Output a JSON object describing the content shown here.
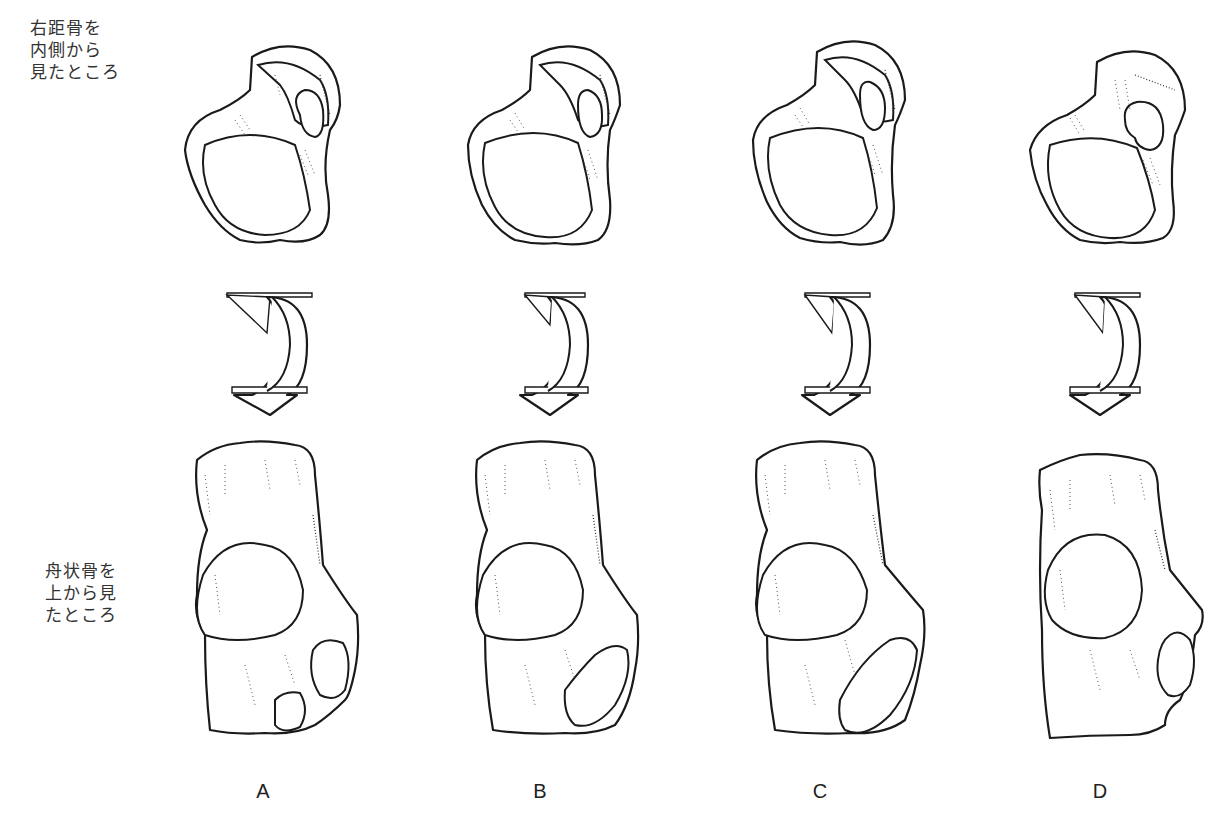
{
  "figure": {
    "row_labels": {
      "talus": "右距骨を\n内側から\n見たところ",
      "navicular": "舟状骨を\n上から見\nたところ"
    },
    "columns": [
      {
        "letter": "A",
        "x": 190
      },
      {
        "letter": "B",
        "x": 470
      },
      {
        "letter": "C",
        "x": 750
      },
      {
        "letter": "D",
        "x": 1025
      }
    ],
    "rows": [
      "talus-medial-view",
      "rotation-arrow",
      "navicular-superior-view"
    ],
    "colors": {
      "line": "#1a1a1a",
      "background": "#ffffff"
    }
  }
}
